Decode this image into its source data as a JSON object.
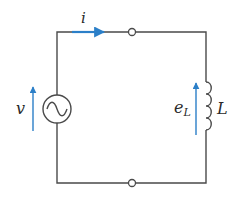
{
  "diagram": {
    "type": "circuit",
    "colors": {
      "wire": "#4a4a4a",
      "arrow": "#2b7fc8",
      "text": "#2a2a2a",
      "background": "#ffffff"
    },
    "labels": {
      "current": "i",
      "source_voltage": "v",
      "inductor_emf": "e",
      "inductor_emf_subscript": "L",
      "inductor": "L"
    },
    "components": [
      {
        "id": "source",
        "kind": "ac-voltage-source",
        "icon": "sine-wave-icon"
      },
      {
        "id": "inductor",
        "kind": "inductor",
        "turns": 4
      },
      {
        "id": "node-top",
        "kind": "terminal-node"
      },
      {
        "id": "node-bottom",
        "kind": "terminal-node"
      }
    ],
    "arrows": [
      {
        "id": "current-arrow",
        "direction": "right",
        "label": "i"
      },
      {
        "id": "source-voltage-arrow",
        "direction": "up",
        "label": "v"
      },
      {
        "id": "inductor-emf-arrow",
        "direction": "up",
        "label": "e_L"
      }
    ]
  }
}
